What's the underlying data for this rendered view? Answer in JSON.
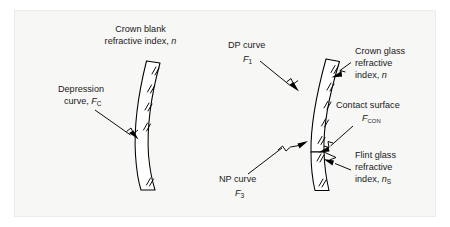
{
  "figure": {
    "background_color": "#f7f7f5",
    "line_color": "#000000",
    "text_color": "#1a1a1a"
  },
  "left_diagram": {
    "name": "crown-blank",
    "labels": {
      "top": {
        "line1": "Crown blank",
        "line2_prefix": "refractive index, ",
        "line2_symbol": "n"
      },
      "depression": {
        "line1": "Depression",
        "line2_prefix": "curve, ",
        "line2_symbol": "F",
        "line2_subscript": "C"
      }
    }
  },
  "right_diagram": {
    "name": "cemented-doublet",
    "labels": {
      "dp_curve": {
        "line1": "DP curve",
        "symbol": "F",
        "subscript": "1"
      },
      "crown_glass": {
        "line1": "Crown glass",
        "line2": "refractive",
        "line3_prefix": "index, ",
        "line3_symbol": "n"
      },
      "contact_surface": {
        "line1": "Contact surface",
        "symbol": "F",
        "subscript": "CON"
      },
      "flint_glass": {
        "line1": "Flint glass",
        "line2": "refractive",
        "line3_prefix": "index, ",
        "line3_symbol": "n",
        "line3_subscript": "S"
      },
      "np_curve": {
        "line1": "NP curve",
        "symbol": "F",
        "subscript": "3"
      }
    }
  }
}
